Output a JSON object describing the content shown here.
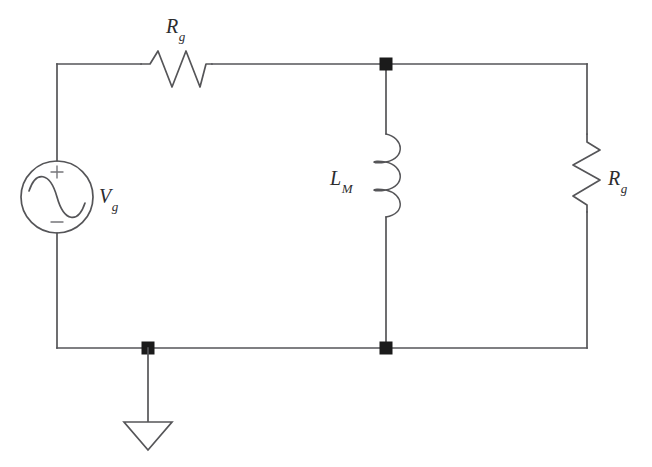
{
  "diagram": {
    "type": "electrical-schematic",
    "background_color": "#ffffff",
    "wire_color": "#555558",
    "node_color": "#1b1b1b",
    "label_color": "#2c2c2e"
  },
  "labels": {
    "source": {
      "symbol": "V",
      "subscript": "g",
      "text": "Vg"
    },
    "series_resistor": {
      "symbol": "R",
      "subscript": "g",
      "text": "Rg"
    },
    "inductor": {
      "symbol": "L",
      "subscript": "M",
      "text": "LM"
    },
    "load_resistor": {
      "symbol": "R",
      "subscript": "g",
      "text": "Rg"
    }
  },
  "source_polarity": {
    "plus": "+",
    "minus": "−"
  },
  "components": [
    {
      "name": "voltage-source",
      "kind": "ac-source",
      "label": "Vg",
      "cx": 57,
      "cy": 197,
      "r": 36
    },
    {
      "name": "series-resistor",
      "kind": "resistor",
      "orientation": "horizontal",
      "label": "Rg",
      "x1": 140,
      "x2": 212,
      "y": 64
    },
    {
      "name": "magnetizing-inductor",
      "kind": "inductor",
      "orientation": "vertical",
      "label": "LM",
      "x": 386,
      "y1": 133,
      "y2": 218
    },
    {
      "name": "load-resistor",
      "kind": "resistor",
      "orientation": "vertical",
      "label": "Rg",
      "x": 587,
      "y1": 133,
      "y2": 212
    },
    {
      "name": "ground",
      "kind": "ground",
      "x": 188,
      "y": 348
    }
  ],
  "nodes": [
    {
      "name": "top-center-node",
      "x": 386,
      "y": 64
    },
    {
      "name": "bottom-center-node",
      "x": 386,
      "y": 348
    },
    {
      "name": "ground-node",
      "x": 188,
      "y": 348
    }
  ]
}
